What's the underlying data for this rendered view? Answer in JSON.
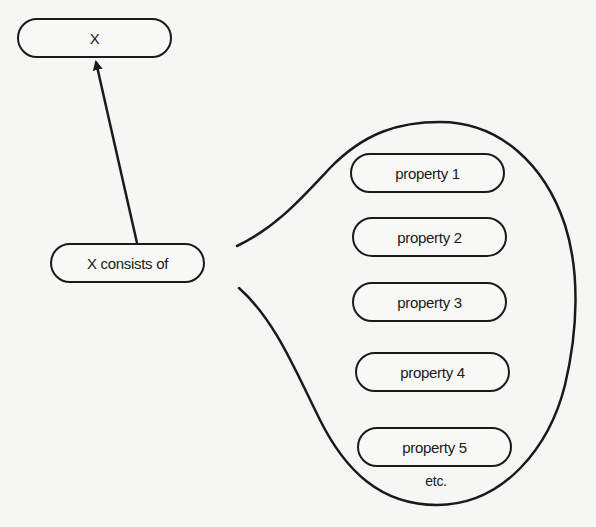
{
  "diagram": {
    "type": "concept-decomposition",
    "colors": {
      "background": "#f6f6f5",
      "stroke": "#1a1a1a",
      "text": "#1a1a1a"
    },
    "nodes": {
      "x": {
        "label": "X"
      },
      "consists_of": {
        "label": "X consists of"
      },
      "properties": [
        {
          "label": "property 1"
        },
        {
          "label": "property 2"
        },
        {
          "label": "property 3"
        },
        {
          "label": "property 4"
        },
        {
          "label": "property 5"
        }
      ],
      "etc": {
        "label": "etc."
      }
    },
    "edges": [
      {
        "from": "X consists of",
        "to": "X",
        "style": "arrow"
      },
      {
        "from": "X consists of",
        "to": "properties group",
        "style": "speech-bubble"
      }
    ]
  }
}
